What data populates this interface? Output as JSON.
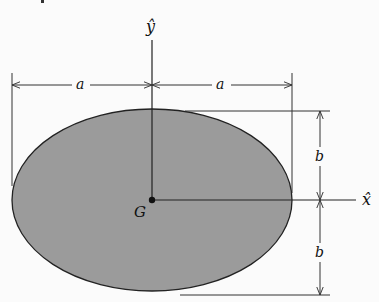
{
  "diagram": {
    "type": "ellipse-dimension-figure",
    "colors": {
      "background": "#fbfbfb",
      "fill": "#9b9b9b",
      "stroke": "#222222",
      "line": "#333333"
    },
    "ellipse": {
      "cx": 152,
      "cy": 200,
      "rx": 140,
      "ry": 91
    },
    "centroid_label": "G",
    "axes": {
      "x_label": "x̂",
      "y_label": "ŷ"
    },
    "dimensions": {
      "left_half_width": "a",
      "right_half_width": "a",
      "upper_half_height": "b",
      "lower_half_height": "b"
    }
  }
}
